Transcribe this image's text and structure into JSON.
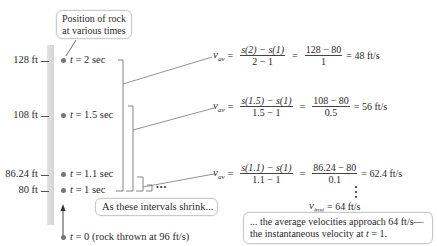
{
  "callouts": {
    "position": [
      "Position of rock",
      "at various times"
    ],
    "intervals": "As these intervals shrink...",
    "conclusion": [
      "... the average velocities approach 64 ft/s—",
      "the instantaneous velocity at "
    ]
  },
  "conclusion_tail": {
    "t": "t",
    "eq": " = 1."
  },
  "positions": [
    {
      "height": "128 ft",
      "t_label": " = 2 sec"
    },
    {
      "height": "108 ft",
      "t_label": " = 1.5 sec"
    },
    {
      "height": "86.24 ft",
      "t_label": " = 1.1 sec"
    },
    {
      "height": "80 ft",
      "t_label": " = 1 sec"
    },
    {
      "height": "",
      "t_label": " = 0 (rock thrown at 96 ft/s)"
    }
  ],
  "t_var": "t",
  "ellipsis": "•••",
  "equations": [
    {
      "lhs": "v",
      "sub": "av",
      "num1": "s(2) − s(1)",
      "den1": "2 − 1",
      "num2": "128 − 80",
      "den2": "1",
      "result": "= 48 ft/s"
    },
    {
      "lhs": "v",
      "sub": "av",
      "num1": "s(1.5) − s(1)",
      "den1": "1.5 − 1",
      "num2": "108 − 80",
      "den2": "0.5",
      "result": "= 56 ft/s"
    },
    {
      "lhs": "v",
      "sub": "av",
      "num1": "s(1.1) − s(1)",
      "den1": "1.1 − 1",
      "num2": "86.24 − 80",
      "den2": "0.1",
      "result": "= 62.4 ft/s"
    }
  ],
  "instantaneous": {
    "lhs": "v",
    "sub": "inst",
    "result": "= 64 ft/s"
  },
  "equals": "="
}
